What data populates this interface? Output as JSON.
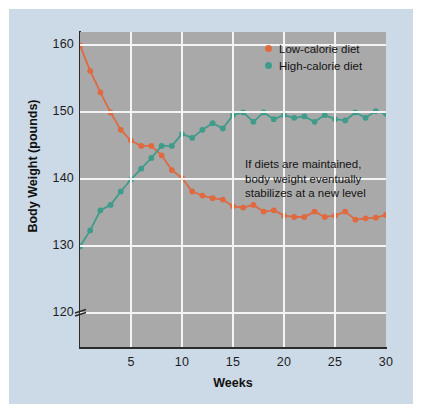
{
  "chart_data": {
    "type": "line",
    "title": "",
    "xlabel": "Weeks",
    "ylabel": "Body Weight (pounds)",
    "xlim": [
      0,
      30
    ],
    "ylim": [
      115,
      162
    ],
    "ytick_labels": [
      "160",
      "150",
      "140",
      "130",
      "120"
    ],
    "ytick_values": [
      160,
      150,
      140,
      130,
      120
    ],
    "xtick_labels": [
      "5",
      "10",
      "15",
      "20",
      "25",
      "30"
    ],
    "xtick_values": [
      5,
      10,
      15,
      20,
      25,
      30
    ],
    "grid": true,
    "axis_break": true,
    "legend_position": "top-right",
    "plot_background": "#a9a9a9",
    "figure_background": "#ccd9e6",
    "gridline_color": "#f4f4f4",
    "x": [
      0,
      1,
      2,
      3,
      4,
      5,
      6,
      7,
      8,
      9,
      10,
      11,
      12,
      13,
      14,
      15,
      16,
      17,
      18,
      19,
      20,
      21,
      22,
      23,
      24,
      25,
      26,
      27,
      28,
      29,
      30
    ],
    "series": [
      {
        "name": "Low-calorie diet",
        "color": "#e0693f",
        "values": [
          160.0,
          156.2,
          153.0,
          150.0,
          147.4,
          145.8,
          145.0,
          145.0,
          143.6,
          141.4,
          140.2,
          138.2,
          137.6,
          137.2,
          137.0,
          136.0,
          135.8,
          136.2,
          135.2,
          135.4,
          134.6,
          134.4,
          134.4,
          135.2,
          134.4,
          134.6,
          135.2,
          134.0,
          134.2,
          134.3,
          134.7
        ]
      },
      {
        "name": "High-calorie diet",
        "color": "#3f9c8a",
        "values": [
          130.0,
          132.4,
          135.4,
          136.2,
          138.2,
          140.0,
          141.6,
          143.2,
          145.0,
          145.0,
          146.8,
          146.2,
          147.4,
          148.4,
          147.6,
          149.6,
          150.0,
          148.6,
          150.0,
          149.0,
          149.6,
          149.2,
          149.4,
          148.6,
          149.6,
          149.0,
          148.8,
          150.0,
          149.2,
          150.2,
          149.8
        ]
      }
    ],
    "annotation": "If diets are maintained,\nbody weight eventually\nstabilizes at a new level"
  },
  "legend": {
    "items": [
      {
        "label": "Low-calorie diet",
        "color": "#e0693f"
      },
      {
        "label": "High-calorie diet",
        "color": "#3f9c8a"
      }
    ]
  }
}
